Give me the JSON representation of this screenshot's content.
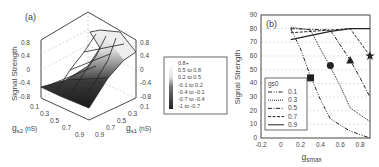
{
  "chart_data": [
    {
      "panel": "(a)",
      "type": "surface3d",
      "title": "",
      "zlabel": "Signal Strength",
      "xlabel": "gs2 (nS)",
      "ylabel": "gs1 (nS)",
      "x_ticks": [
        "0.1",
        "0.3",
        "0.5",
        "0.7",
        "0.9"
      ],
      "y_ticks": [
        "0.1",
        "0.3",
        "0.5",
        "0.7",
        "0.9"
      ],
      "z_ticks": [
        "0.8",
        "0.4",
        "0",
        "-0.4",
        "-0.8"
      ],
      "zlim": [
        -0.8,
        0.8
      ],
      "legend": {
        "position": "right",
        "entries": [
          "0.8+",
          "0.5 to 0.8",
          "0.2 to 0.5",
          "-0.1 to 0.2",
          "-0.4 to -0.1",
          "-0.7 to -0.4",
          "-1 to -0.7"
        ]
      },
      "grid": true,
      "description": "Surface low (~-0.6 to -0.8) for low gs1, rising to plateau (~0.8) for high gs1; weak dependence on gs2"
    },
    {
      "panel": "(b)",
      "type": "line",
      "title": "",
      "xlabel": "gsmax",
      "ylabel": "Signal Strength",
      "xlim": [
        -0.2,
        0.9
      ],
      "ylim": [
        0,
        90
      ],
      "x_ticks": [
        "-0.2",
        "0",
        "0.2",
        "0.4",
        "0.6",
        "0.8"
      ],
      "y_ticks": [
        "0",
        "10",
        "20",
        "30",
        "40",
        "50",
        "60",
        "70",
        "80",
        "90"
      ],
      "grid": true,
      "legend": {
        "title": "gs0",
        "position": "lower-left",
        "entries": [
          "0.1",
          "0.3",
          "0.5",
          "0.7",
          "0.9"
        ]
      },
      "series": [
        {
          "name": "0.1",
          "style": "dash-dot-dot",
          "x": [
            0.1,
            0.2,
            0.3,
            0.4,
            0.5,
            0.7,
            0.9
          ],
          "y": [
            80,
            65,
            45,
            28,
            14,
            5,
            0
          ]
        },
        {
          "name": "0.3",
          "style": "dotted",
          "x": [
            0.1,
            0.3,
            0.4,
            0.5,
            0.6,
            0.7,
            0.9
          ],
          "y": [
            81,
            79,
            65,
            52,
            38,
            22,
            12
          ]
        },
        {
          "name": "0.5",
          "style": "dash-dot",
          "x": [
            0.1,
            0.5,
            0.6,
            0.7,
            0.8,
            0.9
          ],
          "y": [
            80,
            79,
            68,
            57,
            44,
            30
          ]
        },
        {
          "name": "0.7",
          "style": "dashed",
          "x": [
            0.1,
            0.7,
            0.8,
            0.9
          ],
          "y": [
            77,
            80,
            70,
            60
          ]
        },
        {
          "name": "0.9",
          "style": "solid",
          "x": [
            0.1,
            0.5,
            0.7,
            0.9
          ],
          "y": [
            72,
            78,
            80,
            80
          ]
        }
      ],
      "markers": [
        {
          "shape": "square",
          "x": 0.3,
          "y": 44
        },
        {
          "shape": "circle",
          "x": 0.5,
          "y": 53
        },
        {
          "shape": "triangle",
          "x": 0.7,
          "y": 57
        },
        {
          "shape": "star",
          "x": 0.9,
          "y": 60
        }
      ]
    }
  ],
  "labels": {
    "panel_a": "(a)",
    "panel_b": "(b)",
    "a_zlabel": "Signal Strength",
    "a_xlabel_main": "g",
    "a_xlabel_sub": "s2",
    "a_xlabel_unit": " (nS)",
    "a_ylabel_main": "g",
    "a_ylabel_sub": "s1",
    "a_ylabel_unit": " (nS)",
    "b_ylabel": "Signal Strength",
    "b_xlabel_main": "g",
    "b_xlabel_sub": "smax",
    "b_legend_title": "gs0"
  }
}
